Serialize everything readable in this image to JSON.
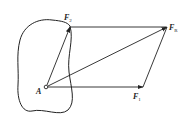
{
  "diagram": {
    "type": "force-parallelogram",
    "colors": {
      "stroke": "#222222",
      "background": "#ffffff"
    },
    "point_A": {
      "label": "A"
    },
    "forces": [
      {
        "name": "F1",
        "label": "F",
        "subscript": "1"
      },
      {
        "name": "F2",
        "label": "F",
        "subscript": "2"
      },
      {
        "name": "FR",
        "label": "F",
        "subscript": "R"
      }
    ]
  }
}
